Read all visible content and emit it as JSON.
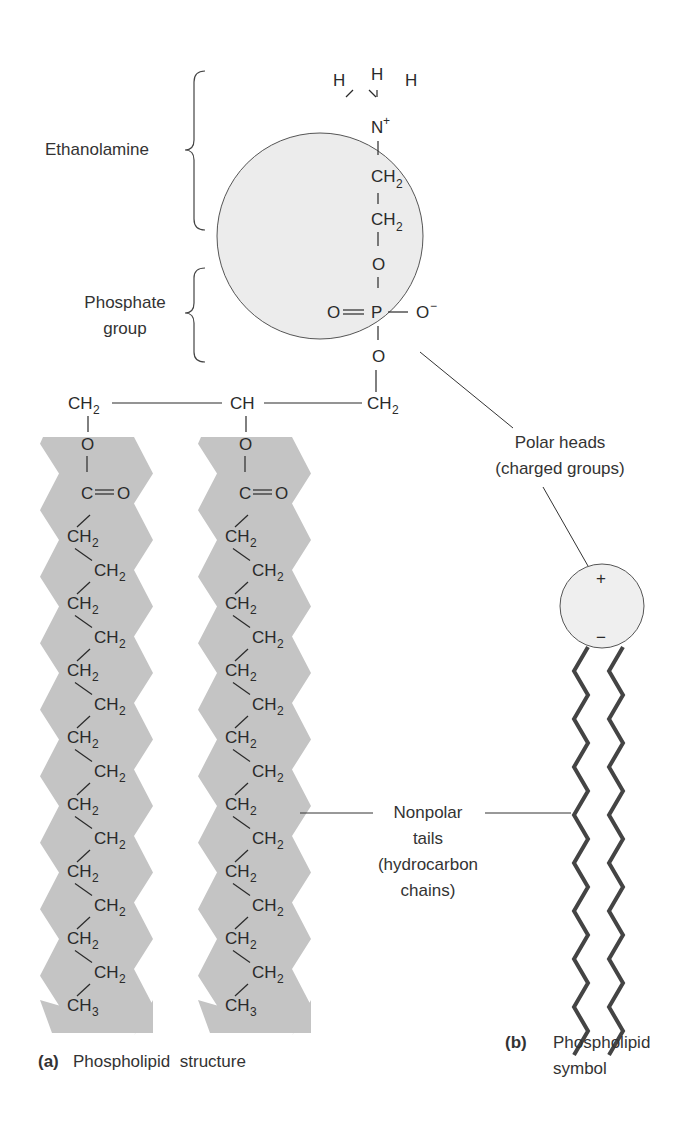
{
  "labels": {
    "ethanolamine": "Ethanolamine",
    "phosphate_line1": "Phosphate",
    "phosphate_line2": "group",
    "polar_line1": "Polar heads",
    "polar_line2": "(charged groups)",
    "nonpolar_line1": "Nonpolar",
    "nonpolar_line2": "tails",
    "nonpolar_line3": "(hydrocarbon",
    "nonpolar_line4": "chains)"
  },
  "captions": {
    "a_marker": "(a)",
    "a_text": "Phospholipid  structure",
    "b_marker": "(b)",
    "b_text_line1": "Phospholipid",
    "b_text_line2": "symbol"
  },
  "head_group": {
    "hydrogens": [
      "H",
      "H",
      "H"
    ],
    "nitrogen": "N",
    "nitrogen_charge": "+",
    "ch2_upper": "CH",
    "ch2_lower": "CH",
    "sub2": "2",
    "oxygen_top": "O",
    "phosphate_o_left": "O",
    "phosphorus": "P",
    "phosphate_o_right": "O",
    "phosphate_o_right_charge": "−",
    "oxygen_bottom": "O"
  },
  "backbone": {
    "left": "CH",
    "left_sub": "2",
    "middle": "CH",
    "right": "CH",
    "right_sub": "2"
  },
  "chains": {
    "ester_o": "O",
    "carbonyl_c": "C",
    "carbonyl_o": "O",
    "repeat_unit": "CH",
    "repeat_sub": "2",
    "repeat_count": 14,
    "terminal": "CH",
    "terminal_sub": "3"
  },
  "symbol": {
    "plus": "+",
    "minus": "−"
  },
  "colors": {
    "head_fill": "#ececec",
    "tail_fill": "#c4c4c4",
    "line": "#333333",
    "symbol_tail": "#444444"
  }
}
